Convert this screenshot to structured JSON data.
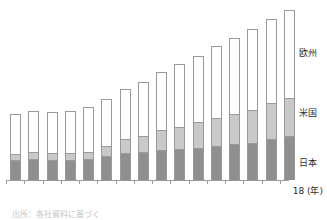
{
  "chart_data": {
    "type": "bar",
    "stacked": true,
    "title": "",
    "subtitle": "",
    "xlabel": "(年)",
    "ylabel": "",
    "grid": false,
    "legend_position": "right-inline",
    "categories": [
      "03",
      "04",
      "05",
      "06",
      "07",
      "08",
      "09",
      "10",
      "11",
      "12",
      "13",
      "14",
      "15",
      "16",
      "17",
      "18"
    ],
    "x_axis_end_label": "18",
    "x_axis_unit": "(年)",
    "series": [
      {
        "name": "日本",
        "color": "#8f8f8f",
        "values": [
          30,
          32,
          31,
          31,
          32,
          36,
          41,
          42,
          45,
          47,
          49,
          52,
          54,
          56,
          62,
          66
        ]
      },
      {
        "name": "米国",
        "color": "#c9c9c9",
        "values": [
          10,
          10,
          10,
          10,
          11,
          16,
          21,
          24,
          30,
          33,
          38,
          42,
          46,
          50,
          54,
          58
        ]
      },
      {
        "name": "欧州",
        "color": "#ffffff",
        "values": [
          60,
          63,
          62,
          64,
          67,
          71,
          76,
          82,
          88,
          95,
          101,
          108,
          115,
          122,
          127,
          133
        ]
      }
    ],
    "totals": [
      100,
      105,
      103,
      105,
      110,
      123,
      138,
      148,
      163,
      175,
      188,
      202,
      215,
      228,
      243,
      257
    ],
    "ylim": [
      0,
      260
    ]
  },
  "labels": {
    "europe": "欧州",
    "us": "米国",
    "japan": "日本",
    "x_axis": "18 (年)"
  },
  "footer": {
    "source_note": "出所：各社資料に基づく"
  },
  "colors": {
    "japan": "#8f8f8f",
    "us": "#c9c9c9",
    "europe": "#ffffff",
    "outline": "#9a9a9a",
    "text": "#2e2e2e"
  }
}
